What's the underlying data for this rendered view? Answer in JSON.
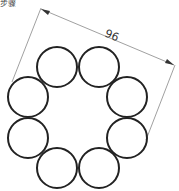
{
  "corner_label": "步骤",
  "dimension": {
    "value": "96",
    "angle_deg": 23
  },
  "circles": [
    {
      "cx": 57,
      "cy": 67,
      "r": 20
    },
    {
      "cx": 99,
      "cy": 67,
      "r": 20
    },
    {
      "cx": 127,
      "cy": 97,
      "r": 20
    },
    {
      "cx": 127,
      "cy": 138,
      "r": 20
    },
    {
      "cx": 99,
      "cy": 168,
      "r": 20
    },
    {
      "cx": 57,
      "cy": 168,
      "r": 20
    },
    {
      "cx": 28,
      "cy": 138,
      "r": 20
    },
    {
      "cx": 28,
      "cy": 97,
      "r": 20
    }
  ],
  "colors": {
    "circle_stroke": "#222222",
    "dimension_stroke": "#777777",
    "text": "#333333"
  }
}
